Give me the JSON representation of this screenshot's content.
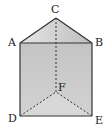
{
  "diagram": {
    "type": "triangular-prism",
    "vertices": {
      "A": {
        "label": "A",
        "x": 20,
        "y": 43
      },
      "B": {
        "label": "B",
        "x": 92,
        "y": 43
      },
      "C": {
        "label": "C",
        "x": 56,
        "y": 18
      },
      "D": {
        "label": "D",
        "x": 20,
        "y": 116
      },
      "E": {
        "label": "E",
        "x": 92,
        "y": 116
      },
      "F": {
        "label": "F",
        "x": 56,
        "y": 92
      }
    },
    "solid_edges": [
      "AB",
      "BC",
      "CA",
      "AD",
      "BE",
      "DE"
    ],
    "dashed_edges": [
      "CF",
      "DF",
      "EF"
    ],
    "colors": {
      "edge": "#333333",
      "front_face": "#c9c9c9",
      "top_face_light": "#e6e6e6",
      "top_face_dark": "#bdbdbd",
      "bottom_face": "#d6d6d6",
      "background": "#ffffff"
    }
  }
}
